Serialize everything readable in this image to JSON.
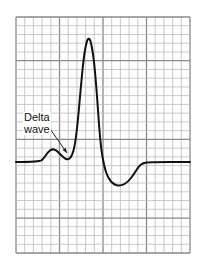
{
  "figure": {
    "type": "ECG tracing on grid paper",
    "annotation": {
      "line1": "Delta",
      "line2": "wave"
    },
    "grid": {
      "left": 16,
      "top": 17,
      "right": 190,
      "bottom": 253,
      "minor_color": "#bdbdbd",
      "major_color": "#8a8a8a",
      "cols": 20,
      "rows": 27,
      "major_every": 5
    },
    "trace": {
      "color": "#111111",
      "stroke_width": 2,
      "points": [
        [
          16,
          162
        ],
        [
          40,
          162
        ],
        [
          44,
          158
        ],
        [
          48,
          152
        ],
        [
          52,
          149
        ],
        [
          56,
          150
        ],
        [
          60,
          154
        ],
        [
          64,
          158
        ],
        [
          68,
          160
        ],
        [
          72,
          156
        ],
        [
          75,
          145
        ],
        [
          78,
          120
        ],
        [
          81,
          85
        ],
        [
          84,
          55
        ],
        [
          87,
          40
        ],
        [
          89,
          38
        ],
        [
          91,
          42
        ],
        [
          94,
          60
        ],
        [
          97,
          95
        ],
        [
          99,
          125
        ],
        [
          101,
          148
        ],
        [
          104,
          166
        ],
        [
          108,
          178
        ],
        [
          114,
          185
        ],
        [
          121,
          186
        ],
        [
          128,
          182
        ],
        [
          134,
          174
        ],
        [
          139,
          166
        ],
        [
          143,
          163
        ],
        [
          150,
          162
        ],
        [
          190,
          162
        ]
      ]
    },
    "arrow": {
      "from": [
        48,
        126
      ],
      "to": [
        67,
        153
      ]
    }
  }
}
